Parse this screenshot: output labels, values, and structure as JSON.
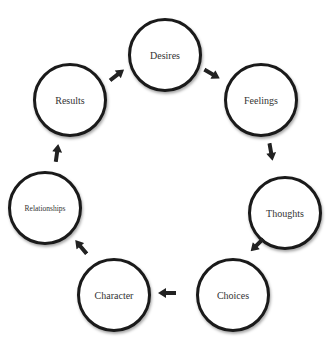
{
  "diagram": {
    "type": "cycle",
    "direction": "clockwise",
    "stroke_color": "#1a1a1a",
    "text_color": "#333333",
    "background": "#ffffff",
    "nodes": [
      {
        "id": "desires",
        "label": "Desires"
      },
      {
        "id": "feelings",
        "label": "Feelings"
      },
      {
        "id": "thoughts",
        "label": "Thoughts"
      },
      {
        "id": "choices",
        "label": "Choices"
      },
      {
        "id": "character",
        "label": "Character"
      },
      {
        "id": "relationships",
        "label": "Relationships"
      },
      {
        "id": "results",
        "label": "Results"
      }
    ],
    "edges": [
      {
        "from": "Desires",
        "to": "Feelings"
      },
      {
        "from": "Feelings",
        "to": "Thoughts"
      },
      {
        "from": "Thoughts",
        "to": "Choices"
      },
      {
        "from": "Choices",
        "to": "Character"
      },
      {
        "from": "Character",
        "to": "Relationships"
      },
      {
        "from": "Relationships",
        "to": "Results"
      },
      {
        "from": "Results",
        "to": "Desires"
      }
    ]
  }
}
